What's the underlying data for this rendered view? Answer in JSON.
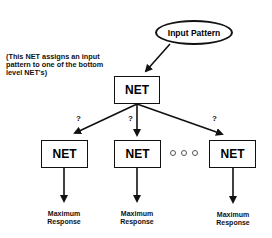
{
  "diagram": {
    "input_node": {
      "label": "Input Pattern",
      "shape": "ellipse"
    },
    "annotation": "(This NET assigns an input pattern to one of the bottom level NET's)",
    "top_net": {
      "label": "NET"
    },
    "branch_labels": [
      "?",
      "?",
      "?"
    ],
    "bottom_nets": [
      {
        "label": "NET",
        "output": "Maximum Response"
      },
      {
        "label": "NET",
        "output": "Maximum Response"
      },
      {
        "label": "NET",
        "output": "Maximum Response"
      }
    ],
    "ellipsis": "o o o",
    "edges": [
      {
        "from": "Input Pattern",
        "to": "top NET"
      },
      {
        "from": "top NET",
        "to": "bottom NET 1",
        "label": "?"
      },
      {
        "from": "top NET",
        "to": "bottom NET 2",
        "label": "?"
      },
      {
        "from": "top NET",
        "to": "bottom NET 3",
        "label": "?"
      },
      {
        "from": "bottom NET 1",
        "to": "Maximum Response"
      },
      {
        "from": "bottom NET 2",
        "to": "Maximum Response"
      },
      {
        "from": "bottom NET 3",
        "to": "Maximum Response"
      }
    ]
  }
}
